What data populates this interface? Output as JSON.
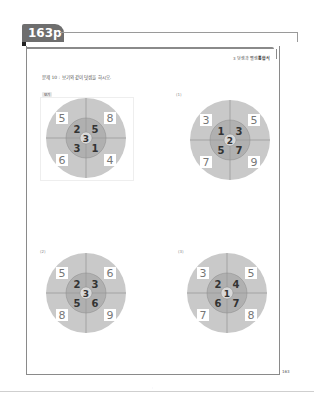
{
  "page_tab": "163p",
  "header": {
    "chapter_num": "3",
    "chapter_text": "덧셈과 뺄셈",
    "chapter_bold": "통합식"
  },
  "instruction": "문제 10 : 보기와 같이 덧셈을 하시오.",
  "example_label": "보기",
  "page_number": "163",
  "footer_mark": "·",
  "colors": {
    "outer": "#c9c9c9",
    "inner": "#b0b0b0",
    "center": "#d9d9d9",
    "line": "#8c8c8c",
    "tab": "#6e6e6e"
  },
  "puzzles": [
    {
      "label": "",
      "corners": [
        "5",
        "8",
        "6",
        "4"
      ],
      "inner": [
        "2",
        "5",
        "3",
        "1"
      ],
      "center": "3"
    },
    {
      "label": "(1)",
      "corners": [
        "3",
        "5",
        "7",
        "9"
      ],
      "inner": [
        "1",
        "3",
        "5",
        "7"
      ],
      "center": "2"
    },
    {
      "label": "(2)",
      "corners": [
        "5",
        "6",
        "8",
        "9"
      ],
      "inner": [
        "2",
        "3",
        "5",
        "6"
      ],
      "center": "3"
    },
    {
      "label": "(3)",
      "corners": [
        "3",
        "5",
        "7",
        "8"
      ],
      "inner": [
        "2",
        "4",
        "6",
        "7"
      ],
      "center": "1"
    }
  ]
}
